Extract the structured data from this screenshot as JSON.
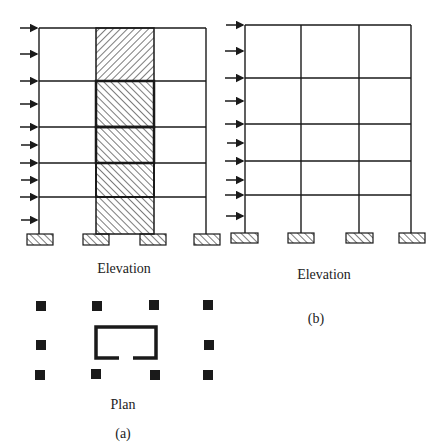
{
  "figure": {
    "panel_a": {
      "elevation_label": "Elevation",
      "plan_label": "Plan",
      "caption": "(a)",
      "description": "Frame with central shear-wall core (hatched) resisting lateral loads"
    },
    "panel_b": {
      "elevation_label": "Elevation",
      "caption": "(b)",
      "description": "Rigid moment frame resisting lateral loads"
    },
    "stories": 5,
    "bays": 3,
    "lateral_load_arrows": 10,
    "colors": {
      "line": "#1a1a1a",
      "background": "#ffffff"
    }
  }
}
